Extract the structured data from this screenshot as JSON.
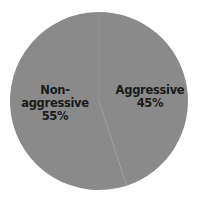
{
  "chart_data": {
    "type": "pie",
    "title": "",
    "categories": [
      "Aggressive",
      "Non-aggressive"
    ],
    "values": [
      45,
      55
    ],
    "labels": [
      "Aggressive\n45%",
      "Non-aggressive\n55%"
    ],
    "colors": [
      "#8a8a8a",
      "#8a8a8a"
    ],
    "start_angle_deg": 0,
    "direction": "clockwise",
    "legend": "none",
    "slices": [
      {
        "name": "Aggressive",
        "value": 45,
        "percent_label": "45%",
        "color": "#8a8a8a"
      },
      {
        "name": "Non-aggressive",
        "value": 55,
        "percent_label": "55%",
        "color": "#8a8a8a"
      }
    ]
  },
  "labels": {
    "aggressive": {
      "name": "Aggressive",
      "percent": "45%"
    },
    "non_aggressive": {
      "name": "Non-aggressive",
      "percent": "55%"
    }
  },
  "style": {
    "slice_color": "#8a8a8a",
    "boundary_color": "#9a9a9a",
    "background": "#ffffff"
  }
}
